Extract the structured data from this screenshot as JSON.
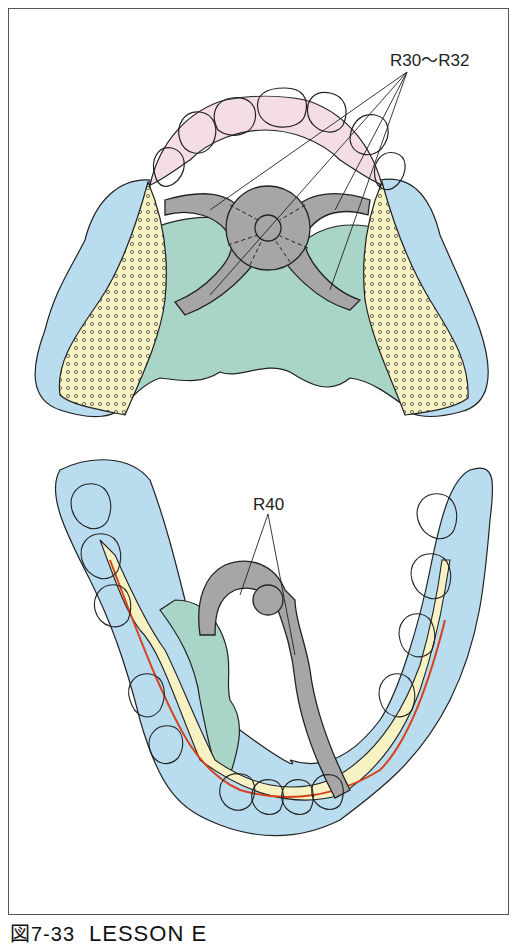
{
  "figure": {
    "caption_prefix": "図7-33",
    "caption_title": "LESSON E",
    "upper_label": "R30〜R32",
    "lower_label": "R40"
  },
  "colors": {
    "gingiva": "#b9dcef",
    "palate_plate": "#a9d4c8",
    "connector_gray": "#a6a6a6",
    "saddle_yellow": "#f6f2c4",
    "anterior_pink": "#f5dde6",
    "clasp_line_red": "#d8401a",
    "outline": "#222222"
  }
}
